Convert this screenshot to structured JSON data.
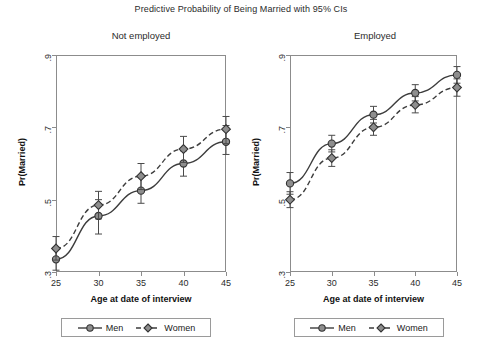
{
  "chart_data": {
    "type": "line",
    "title": "Predictive Probability of Being Married with 95% CIs",
    "xlabel": "Age at date of interview",
    "ylabel": "Pr(Married)",
    "x": [
      25,
      30,
      35,
      40,
      45
    ],
    "xlim": [
      25,
      45
    ],
    "ylim": [
      0.3,
      0.9
    ],
    "xticks": [
      "25",
      "30",
      "35",
      "40",
      "45"
    ],
    "yticks": [
      ".3",
      ".5",
      ".7",
      ".9"
    ],
    "grid": false,
    "legend_position": "below-panel",
    "panels": [
      {
        "name": "not-employed",
        "title": "Not employed",
        "series": [
          {
            "name": "Men",
            "marker": "circle",
            "linestyle": "solid",
            "values": [
              0.335,
              0.455,
              0.525,
              0.6,
              0.66
            ],
            "ci_low": [
              0.305,
              0.405,
              0.49,
              0.565,
              0.625
            ],
            "ci_high": [
              0.368,
              0.5,
              0.565,
              0.635,
              0.705
            ]
          },
          {
            "name": "Women",
            "marker": "diamond",
            "linestyle": "dashed",
            "values": [
              0.365,
              0.485,
              0.565,
              0.64,
              0.695
            ],
            "ci_low": [
              0.333,
              0.447,
              0.528,
              0.603,
              0.655
            ],
            "ci_high": [
              0.398,
              0.523,
              0.6,
              0.675,
              0.73
            ]
          }
        ]
      },
      {
        "name": "employed",
        "title": "Employed",
        "series": [
          {
            "name": "Men",
            "marker": "circle",
            "linestyle": "solid",
            "values": [
              0.545,
              0.655,
              0.735,
              0.795,
              0.845
            ],
            "ci_low": [
              0.515,
              0.632,
              0.712,
              0.773,
              0.822
            ],
            "ci_high": [
              0.575,
              0.678,
              0.758,
              0.818,
              0.868
            ]
          },
          {
            "name": "Women",
            "marker": "diamond",
            "linestyle": "dashed",
            "values": [
              0.5,
              0.615,
              0.7,
              0.762,
              0.81
            ],
            "ci_low": [
              0.478,
              0.592,
              0.678,
              0.74,
              0.786
            ],
            "ci_high": [
              0.522,
              0.638,
              0.722,
              0.785,
              0.834
            ]
          }
        ]
      }
    ],
    "legend": [
      {
        "label": "Men",
        "marker": "circle",
        "linestyle": "solid"
      },
      {
        "label": "Women",
        "marker": "diamond",
        "linestyle": "dashed"
      }
    ],
    "colors": {
      "marker_fill": "#8e8e8e",
      "marker_stroke": "#333333",
      "line": "#3d3d3d",
      "axis": "#8c8c8c",
      "text": "#2b2b2b",
      "background": "#ffffff"
    }
  }
}
